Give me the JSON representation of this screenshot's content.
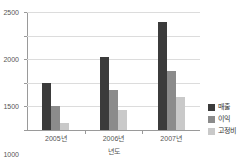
{
  "top_artifact_text": "",
  "chart_data": {
    "type": "bar",
    "title": "",
    "xlabel": "년도",
    "ylabel": "",
    "categories": [
      "2005년",
      "2006년",
      "2007년"
    ],
    "series": [
      {
        "name": "매출",
        "color": "#3b3b3b",
        "values": [
          1000,
          1550,
          2280
        ]
      },
      {
        "name": "이익",
        "color": "#8b8b8b",
        "values": [
          500,
          850,
          1250
        ]
      },
      {
        "name": "고정비",
        "color": "#c9c9c9",
        "values": [
          140,
          420,
          700
        ]
      }
    ],
    "ylim": [
      0,
      2500
    ],
    "yticks": [
      0,
      500,
      1000,
      1500,
      2000,
      2500
    ],
    "ytick_labels": [
      "0",
      "500",
      "1000",
      "1500",
      "2000",
      "2500"
    ],
    "grid": true,
    "legend_position": "right"
  }
}
